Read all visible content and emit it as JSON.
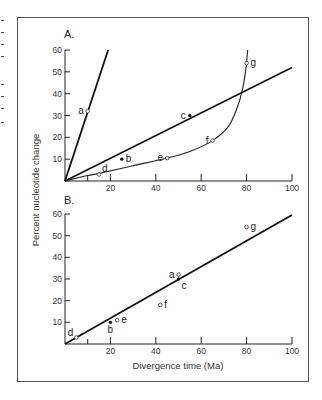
{
  "chart_data": [
    {
      "panel": "A.",
      "type": "scatter",
      "xlim": [
        0,
        100
      ],
      "ylim": [
        0,
        60
      ],
      "xticks": [
        20,
        40,
        60,
        80,
        100
      ],
      "xminor_ticks": [
        10
      ],
      "yticks": [
        10,
        20,
        30,
        40,
        50,
        60
      ],
      "grid": false,
      "points": [
        {
          "label": "a",
          "x": 10,
          "y": 32,
          "marker": "open",
          "label_pos": "left"
        },
        {
          "label": "b",
          "x": 25,
          "y": 10,
          "marker": "filled",
          "label_pos": "right"
        },
        {
          "label": "c",
          "x": 55,
          "y": 30,
          "marker": "filled",
          "label_pos": "left"
        },
        {
          "label": "d",
          "x": 15,
          "y": 3,
          "marker": "open",
          "label_pos": "upper-right"
        },
        {
          "label": "e",
          "x": 45,
          "y": 10.5,
          "marker": "open",
          "label_pos": "left"
        },
        {
          "label": "f",
          "x": 65,
          "y": 18.5,
          "marker": "open",
          "label_pos": "left"
        },
        {
          "label": "g",
          "x": 80,
          "y": 54,
          "marker": "open",
          "label_pos": "right"
        }
      ],
      "lines": [
        {
          "name": "steep-rate-line",
          "kind": "straight",
          "points": [
            [
              0,
              0
            ],
            [
              19,
              60
            ]
          ]
        },
        {
          "name": "moderate-rate-line",
          "kind": "straight",
          "points": [
            [
              0,
              0
            ],
            [
              100,
              52
            ]
          ]
        },
        {
          "name": "accelerating-curve",
          "kind": "curve",
          "points": [
            [
              0,
              0
            ],
            [
              10,
              2.5
            ],
            [
              15,
              3.5
            ],
            [
              30,
              7
            ],
            [
              45,
              10.5
            ],
            [
              55,
              13.5
            ],
            [
              65,
              18.5
            ],
            [
              72,
              25
            ],
            [
              76,
              34
            ],
            [
              78,
              41
            ],
            [
              79.5,
              50
            ],
            [
              80.5,
              60
            ]
          ]
        }
      ]
    },
    {
      "panel": "B.",
      "type": "scatter",
      "xlim": [
        0,
        100
      ],
      "ylim": [
        0,
        60
      ],
      "xticks": [
        20,
        40,
        60,
        80,
        100
      ],
      "xminor_ticks": [
        10
      ],
      "yticks": [
        10,
        20,
        30,
        40,
        50,
        60
      ],
      "grid": false,
      "points": [
        {
          "label": "a",
          "x": 50,
          "y": 32,
          "marker": "open",
          "label_pos": "left"
        },
        {
          "label": "b",
          "x": 20,
          "y": 10,
          "marker": "filled",
          "label_pos": "below"
        },
        {
          "label": "c",
          "x": 50,
          "y": 30,
          "marker": "filled",
          "label_pos": "lower-right"
        },
        {
          "label": "d",
          "x": 5,
          "y": 3,
          "marker": "open",
          "label_pos": "upper-left"
        },
        {
          "label": "e",
          "x": 23,
          "y": 11,
          "marker": "open",
          "label_pos": "right"
        },
        {
          "label": "f",
          "x": 42,
          "y": 18,
          "marker": "open",
          "label_pos": "right"
        },
        {
          "label": "g",
          "x": 80,
          "y": 54,
          "marker": "open",
          "label_pos": "right"
        }
      ],
      "lines": [
        {
          "name": "regression-line",
          "kind": "straight",
          "points": [
            [
              0,
              0
            ],
            [
              100,
              59.5
            ]
          ]
        }
      ]
    }
  ],
  "labels": {
    "ylabel": "Percent nucleotide change",
    "xlabel": "Divergence time (Ma)"
  }
}
